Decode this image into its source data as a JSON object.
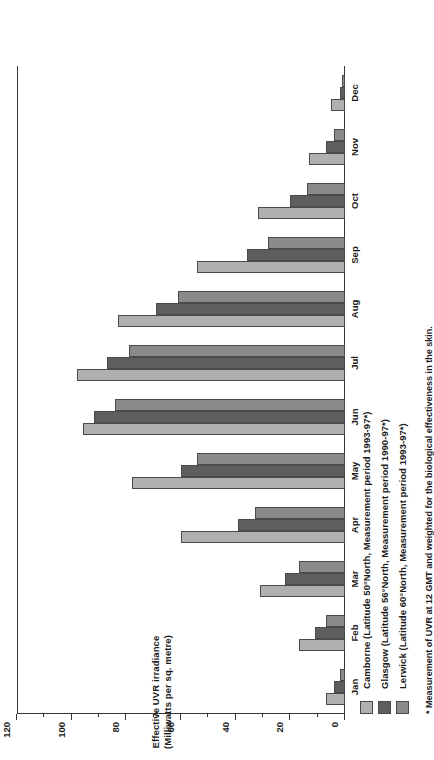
{
  "chart_data": {
    "type": "bar",
    "title": "",
    "xlabel": "",
    "ylabel": "Effective UVR irradiance",
    "ylabel_units": "(Milliwatts per sq. metre)",
    "ylim": [
      0,
      120
    ],
    "ytick_step": 20,
    "yticks": [
      0,
      20,
      40,
      60,
      80,
      100,
      120
    ],
    "ytick_labels": [
      "0",
      "20",
      "40",
      "60",
      "80",
      "100",
      "120"
    ],
    "grid": false,
    "orientation": "horizontal-bars-rotated",
    "legend_position": "below-plot",
    "categories": [
      "Jan",
      "Feb",
      "Mar",
      "Apr",
      "May",
      "Jun",
      "Jul",
      "Aug",
      "Sep",
      "Oct",
      "Nov",
      "Dec"
    ],
    "series": [
      {
        "name": "Camborne",
        "legend_label": "Camborne  (Latitude 50°North, Measurement period 1993-97*)",
        "color": "#b0b0b0",
        "values": [
          7,
          17,
          31,
          60,
          78,
          96,
          98,
          83,
          54,
          32,
          13,
          5
        ]
      },
      {
        "name": "Glasgow",
        "legend_label": "Glasgow (Latitude 56°North, Measurement period 1990-97*)",
        "color": "#5e5e5e",
        "values": [
          4,
          11,
          22,
          39,
          60,
          92,
          87,
          69,
          36,
          20,
          7,
          2
        ]
      },
      {
        "name": "Lerwick",
        "legend_label": "Lerwick (Latitude 60°North, Measurement period 1993-97*)",
        "color": "#8a8a8a",
        "values": [
          2,
          7,
          17,
          33,
          54,
          84,
          79,
          61,
          28,
          14,
          4,
          1
        ]
      }
    ],
    "footnote": "* Measurement of UVR at 12 GMT and weighted for the biological effectiveness in the skin."
  },
  "colors": {
    "axis": "#333333",
    "text": "#1a1a1a",
    "background": "#ffffff"
  }
}
